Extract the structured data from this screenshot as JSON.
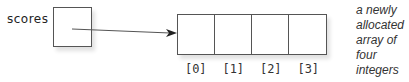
{
  "diagram": {
    "variable": {
      "name": "scores"
    },
    "array": {
      "length": 4,
      "cells": [
        {
          "index_label": "[0]",
          "value": ""
        },
        {
          "index_label": "[1]",
          "value": ""
        },
        {
          "index_label": "[2]",
          "value": ""
        },
        {
          "index_label": "[3]",
          "value": ""
        }
      ]
    },
    "arrow": {
      "from": "scores",
      "to": "array"
    },
    "annotation": "a newly allocated array of four integers",
    "colors": {
      "stroke": "#555555",
      "text": "#333333",
      "background": "#ffffff"
    }
  }
}
